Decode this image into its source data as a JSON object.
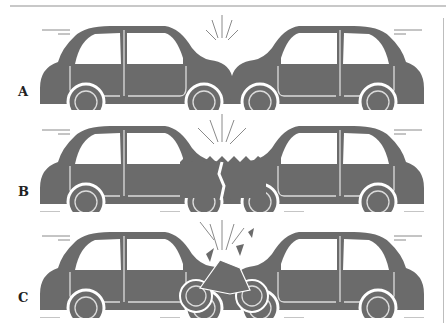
{
  "figure": {
    "panels": [
      {
        "label": "A",
        "description": "Two cars colliding front to front, bumpers touching"
      },
      {
        "label": "B",
        "description": "Two cars colliding with crumpled front ends"
      },
      {
        "label": "C",
        "description": "Two cars colliding with a motorcycle crushed between them"
      }
    ],
    "colors": {
      "car": "#6b6b6b",
      "outline": "#dcdcdc",
      "impact_lines": "#8a8a8a"
    }
  }
}
